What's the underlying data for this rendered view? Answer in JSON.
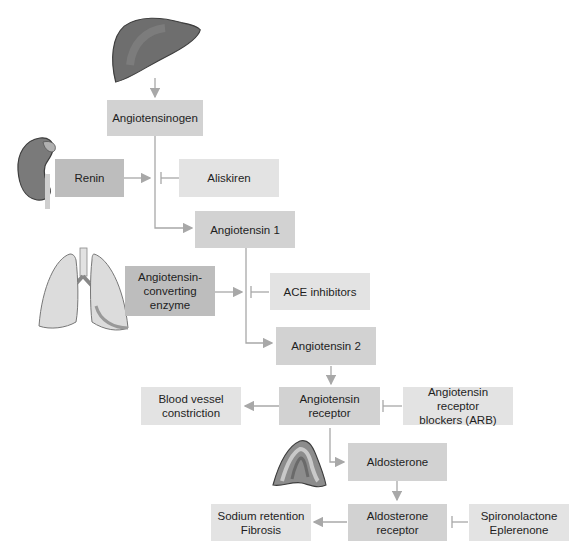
{
  "diagram": {
    "nodes": {
      "angiotensinogen": "Angiotensinogen",
      "renin": "Renin",
      "aliskiren": "Aliskiren",
      "angiotensin1": "Angiotensin 1",
      "ace": "Angiotensin-\nconverting\nenzyme",
      "ace_inhibitors": "ACE inhibitors",
      "angiotensin2": "Angiotensin 2",
      "at_receptor": "Angiotensin\nreceptor",
      "vasoconstriction": "Blood vessel\nconstriction",
      "arb": "Angiotensin receptor\nblockers (ARB)",
      "aldosterone": "Aldosterone",
      "aldo_receptor": "Aldosterone\nreceptor",
      "sodium": "Sodium retention\nFibrosis",
      "antagonists": "Spironolactone\nEplerenone"
    },
    "organs": [
      "liver-icon",
      "kidney-icon",
      "lungs-icon",
      "adrenal-gland-icon"
    ],
    "colors": {
      "box_light": "#e3e3e3",
      "box_mid": "#d2d2d2",
      "box_dark": "#bdbdbd",
      "arrow": "#a8a8a8",
      "organ": "#6b6b6b"
    }
  }
}
